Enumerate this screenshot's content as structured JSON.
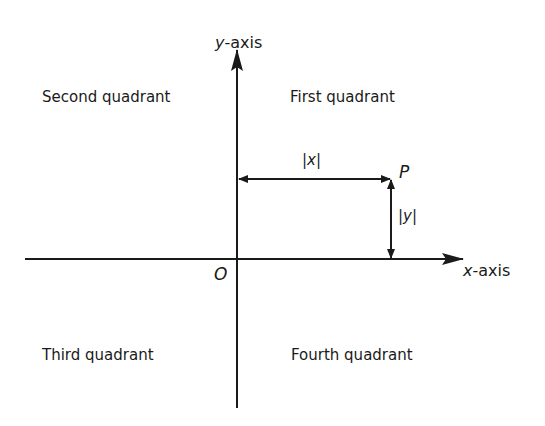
{
  "diagram": {
    "axes": {
      "x_label_var": "x",
      "x_label_rest": "-axis",
      "y_label_var": "y",
      "y_label_rest": "-axis",
      "origin_label": "O"
    },
    "quadrants": {
      "first": "First quadrant",
      "second": "Second quadrant",
      "third": "Third quadrant",
      "fourth": "Fourth quadrant"
    },
    "point": {
      "label": "P",
      "x_distance_label": "|x|",
      "y_distance_label": "|y|"
    },
    "colors": {
      "line": "#1a1a1a",
      "background": "#ffffff"
    }
  }
}
